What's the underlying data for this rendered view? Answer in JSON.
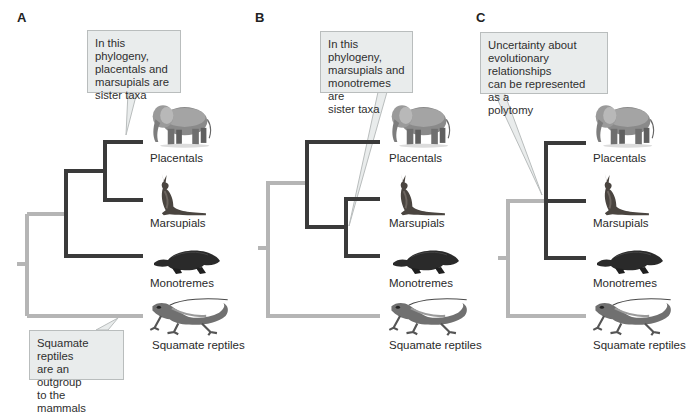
{
  "figure": {
    "colors": {
      "mammal_branch": "#3a3a3a",
      "outgroup_branch": "#b5b5b5",
      "callout_fill": "#e9ecec",
      "callout_border": "#b9bdbd",
      "background": "#ffffff"
    },
    "panels": [
      {
        "letter": "A",
        "callout": "In this phylogeny,\nplacentals and\nmarsupials are\nsister taxa",
        "callout2": "Squamate reptiles\nare an outgroup\nto the mammals",
        "topology": "((Placentals, Marsupials), Monotremes), Squamate reptiles",
        "taxa": [
          "Placentals",
          "Marsupials",
          "Monotremes",
          "Squamate reptiles"
        ]
      },
      {
        "letter": "B",
        "callout": "In this phylogeny,\nmarsupials and\nmonotremes are\nsister taxa",
        "topology": "(Placentals, (Marsupials, Monotremes)), Squamate reptiles",
        "taxa": [
          "Placentals",
          "Marsupials",
          "Monotremes",
          "Squamate reptiles"
        ]
      },
      {
        "letter": "C",
        "callout": "Uncertainty about\nevolutionary relationships\ncan be represented as a\npolytomy",
        "topology": "(Placentals, Marsupials, Monotremes), Squamate reptiles",
        "taxa": [
          "Placentals",
          "Marsupials",
          "Monotremes",
          "Squamate reptiles"
        ]
      }
    ],
    "icons": [
      "elephant-icon",
      "kangaroo-icon",
      "platypus-icon",
      "lizard-icon"
    ]
  }
}
